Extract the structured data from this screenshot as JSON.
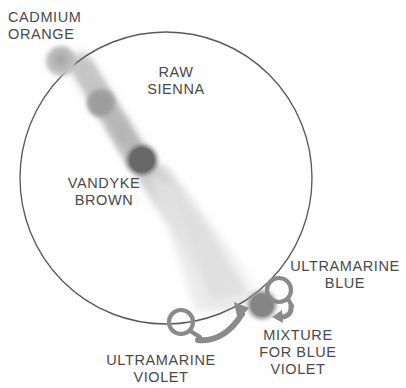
{
  "diagram": {
    "type": "color-wheel",
    "background_color": "#fefefe",
    "wheel": {
      "name": "color-wheel-circle",
      "center_x": 166,
      "center_y": 178,
      "radius": 146,
      "stroke_color": "#5a5a5a"
    },
    "labels": {
      "cadmium_orange": "CADMIUM\nORANGE",
      "raw_sienna": "RAW\nSIENNA",
      "vandyke_brown": "VANDYKE\nBROWN",
      "ultramarine_blue": "ULTRAMARINE\nBLUE",
      "ultramarine_violet": "ULTRAMARINE\nVIOLET",
      "mixture_for_blue_violet": "MIXTURE\nFOR BLUE\nVIOLET"
    },
    "swatches": [
      {
        "name": "cadmium-orange-swatch",
        "label": "CADMIUM ORANGE",
        "cx": 61,
        "cy": 61,
        "r": 14,
        "color": "#b9b9b9"
      },
      {
        "name": "raw-sienna-swatch",
        "label": "RAW SIENNA",
        "cx": 101,
        "cy": 103,
        "r": 13,
        "color": "#a3a3a3"
      },
      {
        "name": "vandyke-brown-swatch",
        "label": "VANDYKE BROWN",
        "cx": 142,
        "cy": 160,
        "r": 14,
        "color": "#6e6e6e"
      },
      {
        "name": "mixture-for-blue-violet-swatch",
        "label": "MIXTURE FOR BLUE VIOLET",
        "cx": 262,
        "cy": 305,
        "r": 13,
        "color": "#8b8b8b"
      }
    ],
    "streak": {
      "name": "paint-streak",
      "description": "diagonal fan of paint from upper-left to lower-right",
      "color": "#d6d6d6"
    },
    "markers": [
      {
        "name": "ultramarine-violet-marker",
        "label": "ULTRAMARINE VIOLET",
        "cx": 181,
        "cy": 323,
        "r": 13,
        "color": "#8a8a8a"
      },
      {
        "name": "ultramarine-blue-marker",
        "label": "ULTRAMARINE BLUE",
        "cx": 279,
        "cy": 291,
        "r": 13,
        "color": "#8a8a8a"
      }
    ],
    "arrows": [
      {
        "name": "violet-to-mixture-arrow",
        "from": "ULTRAMARINE VIOLET",
        "to": "MIXTURE FOR BLUE VIOLET",
        "color": "#8a8a8a"
      },
      {
        "name": "blue-to-mixture-arrow",
        "from": "ULTRAMARINE BLUE",
        "to": "MIXTURE FOR BLUE VIOLET",
        "color": "#8a8a8a"
      }
    ]
  }
}
